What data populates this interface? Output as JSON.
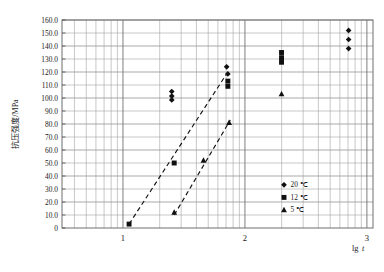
{
  "chart_data": {
    "type": "scatter",
    "title": "",
    "xlabel": "lgt",
    "ylabel": "抗压强度/MPa",
    "xlim": [
      0.5,
      3.05
    ],
    "ylim": [
      0,
      160
    ],
    "grid": true,
    "x_scale": "log-minor-gridlines",
    "x_ticks": [
      "1",
      "2",
      "3"
    ],
    "x_tick_values": [
      1,
      2,
      3
    ],
    "y_ticks": [
      "0",
      "10.0",
      "20.0",
      "30.0",
      "40.0",
      "50.0",
      "60.0",
      "70.0",
      "80.0",
      "90.0",
      "100.0",
      "110.0",
      "120.0",
      "130.0",
      "140.0",
      "150.0",
      "160.0"
    ],
    "y_tick_values": [
      0,
      10,
      20,
      30,
      40,
      50,
      60,
      70,
      80,
      90,
      100,
      110,
      120,
      130,
      140,
      150,
      160
    ],
    "legend_position": "inside-bottom-right",
    "series": [
      {
        "name": "20 ℃",
        "marker": "diamond",
        "color": "#101010",
        "points": [
          {
            "x": 1.4,
            "y": 105.0
          },
          {
            "x": 1.4,
            "y": 101.5
          },
          {
            "x": 1.4,
            "y": 98.5
          },
          {
            "x": 1.85,
            "y": 124.0
          },
          {
            "x": 1.86,
            "y": 118.5
          },
          {
            "x": 2.85,
            "y": 152.0
          },
          {
            "x": 2.85,
            "y": 145.0
          },
          {
            "x": 2.85,
            "y": 138.0
          }
        ]
      },
      {
        "name": "12 ℃",
        "marker": "square",
        "color": "#101010",
        "points": [
          {
            "x": 1.05,
            "y": 3.0
          },
          {
            "x": 1.42,
            "y": 50.0
          },
          {
            "x": 1.86,
            "y": 113.0
          },
          {
            "x": 1.86,
            "y": 109.0
          },
          {
            "x": 2.3,
            "y": 135.0
          },
          {
            "x": 2.3,
            "y": 131.0
          },
          {
            "x": 2.3,
            "y": 127.5
          }
        ]
      },
      {
        "name": "5 ℃",
        "marker": "triangle",
        "color": "#101010",
        "points": [
          {
            "x": 1.42,
            "y": 12.0
          },
          {
            "x": 1.66,
            "y": 52.0
          },
          {
            "x": 1.87,
            "y": 81.0
          },
          {
            "x": 2.3,
            "y": 103.0
          }
        ]
      }
    ],
    "trend_lines": [
      {
        "name": "trend-12C",
        "style": "dashed",
        "x0": 1.05,
        "y0": 3.0,
        "x1": 1.86,
        "y1": 120.0
      },
      {
        "name": "trend-5C",
        "style": "dashed",
        "x0": 1.42,
        "y0": 10.0,
        "x1": 1.88,
        "y1": 83.0
      }
    ],
    "legend": [
      {
        "label": "20 ℃",
        "marker": "diamond"
      },
      {
        "label": "12 ℃",
        "marker": "square"
      },
      {
        "label": "5 ℃",
        "marker": "triangle"
      }
    ]
  }
}
